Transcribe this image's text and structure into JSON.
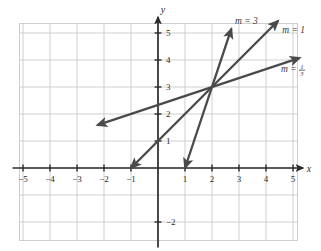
{
  "chart_data": {
    "type": "line",
    "title": "",
    "xlabel": "x",
    "ylabel": "y",
    "xlim": [
      -5.8,
      5.9
    ],
    "ylim": [
      -2.8,
      5.9
    ],
    "grid": true,
    "legend_position": "inline-right",
    "x_ticks": [
      -5,
      -4,
      -3,
      -2,
      -1,
      1,
      2,
      3,
      4,
      5
    ],
    "x_tick_labels": [
      "−5",
      "−4",
      "−3",
      "−2",
      "−1",
      "1",
      "2",
      "3",
      "4",
      "5"
    ],
    "y_ticks": [
      1,
      2,
      3,
      4,
      5,
      -2
    ],
    "y_tick_labels": [
      "1",
      "2",
      "3",
      "4",
      "5",
      "−2"
    ],
    "common_point": [
      2,
      3
    ],
    "series": [
      {
        "name": "m = 3",
        "slope": 3,
        "through": [
          2,
          3
        ],
        "label": "m = 3",
        "label_is_fraction": false,
        "x_from": 1.0,
        "x_to": 2.72,
        "label_x": 2.85,
        "label_y": 5.35
      },
      {
        "name": "m = 1",
        "slope": 1,
        "through": [
          2,
          3
        ],
        "label": "m = 1",
        "label_is_fraction": false,
        "x_from": -1.0,
        "x_to": 4.45,
        "label_x": 4.6,
        "label_y": 5.0
      },
      {
        "name": "m = 1/3",
        "slope": 0.3333,
        "through": [
          2,
          3
        ],
        "label": "m =",
        "label_is_fraction": true,
        "fraction_numerator": "1",
        "fraction_denominator": "3",
        "x_from": -2.25,
        "x_to": 5.25,
        "label_x": 4.55,
        "label_y": 3.55
      }
    ],
    "colors": {
      "line": "#4a4a4a",
      "axis": "#2b2b2b",
      "grid": "#c9c9c9",
      "background": "#ffffff",
      "text": "#2b2b2b"
    }
  },
  "axes": {
    "x_name": "x",
    "y_name": "y"
  }
}
